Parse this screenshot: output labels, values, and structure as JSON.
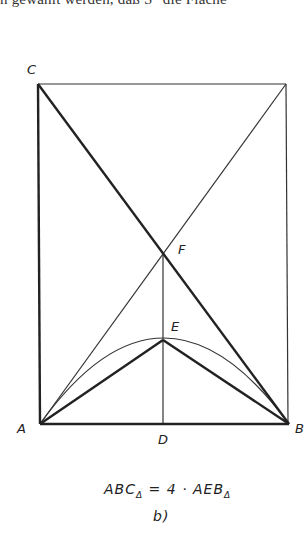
{
  "header_text": "n gewählt werden, daß S″ die Fläche",
  "diagram": {
    "points": {
      "A": {
        "label": "A",
        "x": 40,
        "y": 424
      },
      "B": {
        "label": "B",
        "x": 289,
        "y": 424
      },
      "C": {
        "label": "C",
        "x": 38,
        "y": 84
      },
      "D": {
        "label": "D",
        "x": 163,
        "y": 424
      },
      "E": {
        "label": "E",
        "x": 163,
        "y": 340
      },
      "F": {
        "label": "F",
        "x": 163,
        "y": 253
      },
      "G": {
        "label": "",
        "x": 286,
        "y": 84
      }
    },
    "formula": {
      "left": "ABC",
      "left_sub": "Δ",
      "middle": " = 4 · AEB",
      "right_sub": "Δ"
    },
    "caption": "b)"
  },
  "colors": {
    "line": "#222222",
    "background": "#ffffff"
  }
}
